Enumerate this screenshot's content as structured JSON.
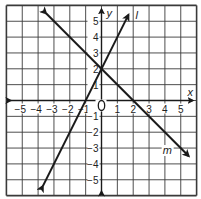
{
  "chart_data": {
    "type": "line",
    "title": "",
    "xlabel": "x",
    "ylabel": "y",
    "xlim": [
      -6,
      6
    ],
    "ylim": [
      -6,
      6
    ],
    "grid": true,
    "x_ticks": [
      -5,
      -4,
      -3,
      -2,
      -1,
      1,
      2,
      3,
      4,
      5
    ],
    "y_ticks": [
      -5,
      -4,
      -3,
      -2,
      -1,
      1,
      2,
      3,
      4,
      5
    ],
    "x_tick_labels": [
      "−5",
      "−4",
      "−3",
      "−2",
      "−1",
      "1",
      "2",
      "3",
      "4",
      "5"
    ],
    "y_tick_labels": [
      "−5",
      "−4",
      "−3",
      "−2",
      "−1",
      "1",
      "2",
      "3",
      "4",
      "5"
    ],
    "origin_label": "0",
    "series": [
      {
        "name": "l",
        "label": "l",
        "equation": "y = 2x + 2",
        "slope": 2,
        "intercept": 2,
        "x": [
          -3.7,
          1.7
        ],
        "y": [
          -5.4,
          5.4
        ],
        "arrows": "both",
        "color": "#1a1a1a"
      },
      {
        "name": "m",
        "label": "m",
        "equation": "y = -x + 2",
        "slope": -1,
        "intercept": 2,
        "x": [
          -3.5,
          5.5
        ],
        "y": [
          5.5,
          -3.5
        ],
        "arrows": "both",
        "color": "#1a1a1a"
      }
    ],
    "intersection": {
      "x": 0,
      "y": 2
    },
    "x_intercepts": {
      "l": -1,
      "m": 2
    }
  }
}
